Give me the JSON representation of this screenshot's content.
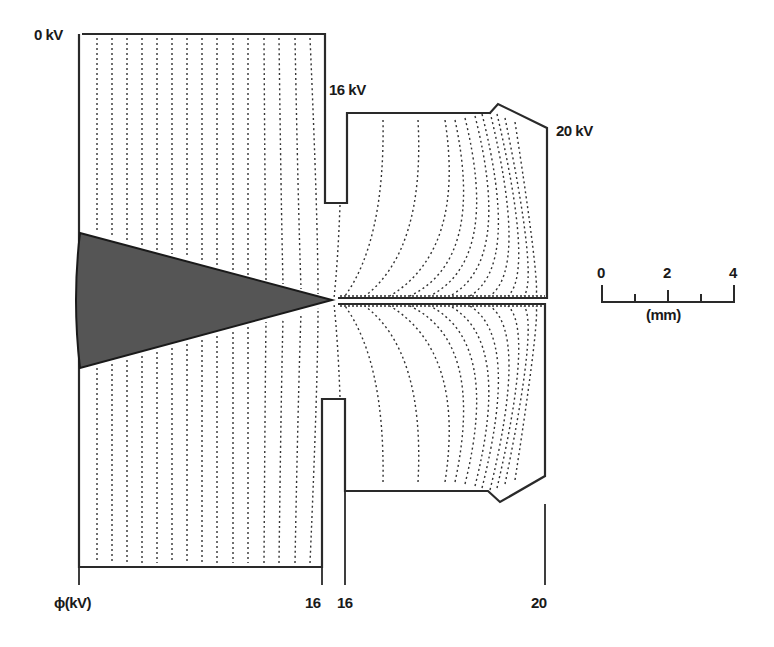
{
  "labels": {
    "top_left_potential": "0 kV",
    "inner_electrode_potential": "16 kV",
    "outer_electrode_potential": "20 kV"
  },
  "axis": {
    "phi_label": "ϕ(kV)",
    "tick_16a": "16",
    "tick_16b": "16",
    "tick_20": "20"
  },
  "scale_bar": {
    "ticks": [
      "0",
      "2",
      "4"
    ],
    "unit": "(mm)"
  },
  "colors": {
    "cone_fill": "#555555",
    "lines": "#333333",
    "background": "#ffffff"
  }
}
